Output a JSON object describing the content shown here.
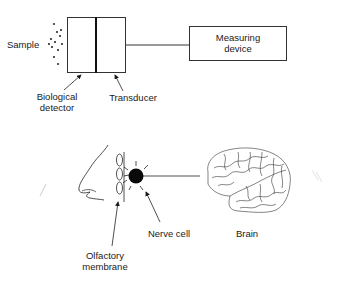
{
  "diagram": {
    "type": "biosensor-vs-olfactory-system-analogy",
    "top": {
      "sample_label": "Sample",
      "biological_detector_label_line1": "Biological",
      "biological_detector_label_line2": "detector",
      "transducer_label": "Transducer",
      "measuring_device_label_line1": "Measuring",
      "measuring_device_label_line2": "device"
    },
    "bottom": {
      "nerve_cell_label": "Nerve cell",
      "brain_label": "Brain",
      "olfactory_label_line1": "Olfactory",
      "olfactory_label_line2": "membrane"
    },
    "colors": {
      "ink": "#1a1a1a",
      "background": "#ffffff"
    }
  }
}
